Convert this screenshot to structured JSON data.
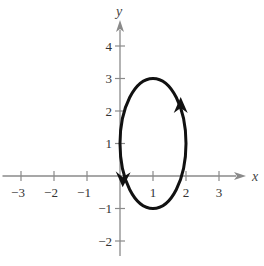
{
  "chart_data": {
    "type": "line",
    "title": "",
    "xlabel": "x",
    "ylabel": "y",
    "xlim": [
      -3.5,
      3.9
    ],
    "ylim": [
      -2.5,
      4.8
    ],
    "xticks": [
      -3,
      -2,
      -1,
      1,
      2,
      3
    ],
    "xtick_labels": [
      "−3",
      "−2",
      "−1",
      "1",
      "2",
      "3"
    ],
    "yticks": [
      -2,
      -1,
      1,
      2,
      3,
      4
    ],
    "ytick_labels": [
      "−2",
      "−1",
      "1",
      "2",
      "3",
      "4"
    ],
    "grid": false,
    "series": [
      {
        "name": "ellipse",
        "center": [
          1,
          1
        ],
        "semi_axis_x": 1,
        "semi_axis_y": 2,
        "direction": "counterclockwise",
        "arrows": [
          {
            "at": [
              1.9,
              2.0
            ],
            "direction": "up"
          },
          {
            "at": [
              0.05,
              -0.1
            ],
            "direction": "down"
          }
        ]
      }
    ]
  }
}
